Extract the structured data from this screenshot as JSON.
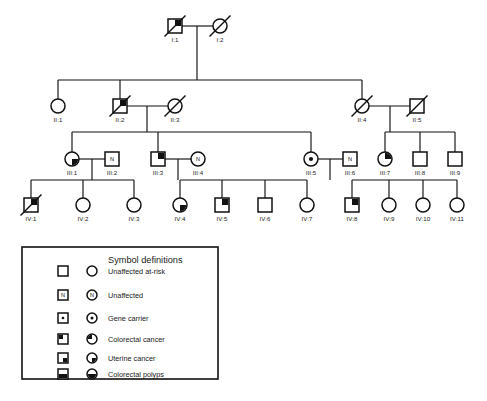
{
  "figure": {
    "type": "pedigree-chart",
    "background": "#ffffff",
    "line_color": "#111111",
    "fill_color": "#121212"
  },
  "legend": {
    "title": "Symbol definitions",
    "rows": [
      {
        "label": "Unaffected at-risk",
        "pattern": "empty"
      },
      {
        "label": "Unaffected",
        "pattern": "letter-n",
        "letter": "N"
      },
      {
        "label": "Gene carrier",
        "pattern": "center-dot"
      },
      {
        "label": "Colorectal cancer",
        "pattern": "upper-left"
      },
      {
        "label": "Uterine cancer",
        "pattern": "lower-right"
      },
      {
        "label": "Colorectal polyps",
        "pattern": "lower-half"
      }
    ]
  },
  "generations": [
    {
      "roman": "I",
      "individuals": [
        {
          "id": "I:1",
          "sex": "male",
          "pattern": "upper-right",
          "deceased": true
        },
        {
          "id": "I:2",
          "sex": "female",
          "pattern": "empty",
          "deceased": true
        }
      ]
    },
    {
      "roman": "II",
      "individuals": [
        {
          "id": "II:1",
          "sex": "female",
          "pattern": "empty",
          "deceased": false
        },
        {
          "id": "II:2",
          "sex": "male",
          "pattern": "upper-right",
          "deceased": true
        },
        {
          "id": "II:3",
          "sex": "female",
          "pattern": "empty",
          "deceased": true
        },
        {
          "id": "II:4",
          "sex": "female",
          "pattern": "empty",
          "deceased": true
        },
        {
          "id": "II:5",
          "sex": "male",
          "pattern": "empty",
          "deceased": true
        }
      ]
    },
    {
      "roman": "III",
      "individuals": [
        {
          "id": "III:1",
          "sex": "female",
          "pattern": "lower-right",
          "deceased": false
        },
        {
          "id": "III:2",
          "sex": "male",
          "pattern": "letter-n",
          "letter": "N",
          "deceased": false
        },
        {
          "id": "III:3",
          "sex": "male",
          "pattern": "upper-right",
          "deceased": false
        },
        {
          "id": "III:4",
          "sex": "female",
          "pattern": "letter-n",
          "letter": "N",
          "deceased": false
        },
        {
          "id": "III:5",
          "sex": "female",
          "pattern": "center-dot",
          "deceased": false
        },
        {
          "id": "III:6",
          "sex": "male",
          "pattern": "letter-n",
          "letter": "N",
          "deceased": false
        },
        {
          "id": "III:7",
          "sex": "female",
          "pattern": "upper-right",
          "deceased": false
        },
        {
          "id": "III:8",
          "sex": "male",
          "pattern": "empty",
          "deceased": false
        },
        {
          "id": "III:9",
          "sex": "male",
          "pattern": "empty",
          "deceased": false
        }
      ]
    },
    {
      "roman": "IV",
      "individuals": [
        {
          "id": "IV:1",
          "sex": "male",
          "pattern": "upper-right",
          "deceased": true
        },
        {
          "id": "IV:2",
          "sex": "female",
          "pattern": "empty",
          "deceased": false
        },
        {
          "id": "IV:3",
          "sex": "female",
          "pattern": "empty",
          "deceased": false
        },
        {
          "id": "IV:4",
          "sex": "female",
          "pattern": "lower-right",
          "deceased": false
        },
        {
          "id": "IV:5",
          "sex": "male",
          "pattern": "upper-right",
          "deceased": false
        },
        {
          "id": "IV:6",
          "sex": "male",
          "pattern": "empty",
          "deceased": false
        },
        {
          "id": "IV:7",
          "sex": "female",
          "pattern": "empty",
          "deceased": false
        },
        {
          "id": "IV:8",
          "sex": "male",
          "pattern": "upper-right",
          "deceased": false
        },
        {
          "id": "IV:9",
          "sex": "female",
          "pattern": "empty",
          "deceased": false
        },
        {
          "id": "IV:10",
          "sex": "female",
          "pattern": "empty",
          "deceased": false
        },
        {
          "id": "IV:11",
          "sex": "female",
          "pattern": "empty",
          "deceased": false
        }
      ]
    }
  ],
  "layout": {
    "symbol_half": 7.0,
    "legend_symbol_half": 5.0,
    "positions": {
      "I:1": {
        "x": 175,
        "y": 26
      },
      "I:2": {
        "x": 220,
        "y": 26
      },
      "II:1": {
        "x": 58,
        "y": 106
      },
      "II:2": {
        "x": 120,
        "y": 106
      },
      "II:3": {
        "x": 175,
        "y": 106
      },
      "II:4": {
        "x": 362,
        "y": 106
      },
      "II:5": {
        "x": 417,
        "y": 106
      },
      "III:1": {
        "x": 72,
        "y": 159
      },
      "III:2": {
        "x": 112,
        "y": 159
      },
      "III:3": {
        "x": 158,
        "y": 159
      },
      "III:4": {
        "x": 198,
        "y": 159
      },
      "III:5": {
        "x": 311,
        "y": 159
      },
      "III:6": {
        "x": 350,
        "y": 159
      },
      "III:7": {
        "x": 385,
        "y": 159
      },
      "III:8": {
        "x": 420,
        "y": 159
      },
      "III:9": {
        "x": 455,
        "y": 159
      },
      "IV:1": {
        "x": 31,
        "y": 205
      },
      "IV:2": {
        "x": 83,
        "y": 205
      },
      "IV:3": {
        "x": 134,
        "y": 205
      },
      "IV:4": {
        "x": 180,
        "y": 205
      },
      "IV:5": {
        "x": 222,
        "y": 205
      },
      "IV:6": {
        "x": 265,
        "y": 205
      },
      "IV:7": {
        "x": 307,
        "y": 205
      },
      "IV:8": {
        "x": 352,
        "y": 205
      },
      "IV:9": {
        "x": 389,
        "y": 205
      },
      "IV:10": {
        "x": 423,
        "y": 205
      },
      "IV:11": {
        "x": 457,
        "y": 205
      }
    },
    "legend_rect": {
      "x": 22,
      "y": 247,
      "w": 196,
      "h": 132
    },
    "legend_square_x": 63,
    "legend_circle_x": 92,
    "legend_text_x": 108,
    "legend_title_x": 108,
    "legend_title_y": 263,
    "legend_row_y": [
      271,
      295,
      318,
      339,
      358,
      374
    ]
  },
  "connections": {
    "mating_lines": [
      {
        "name": "I1-I2",
        "x1": 182,
        "x2": 213,
        "y": 26
      },
      {
        "name": "II2-II3",
        "x1": 127,
        "x2": 168,
        "y": 106
      },
      {
        "name": "II4-II5",
        "x1": 369,
        "x2": 410,
        "y": 106
      },
      {
        "name": "III1-III2",
        "x1": 79,
        "x2": 105,
        "y": 159
      },
      {
        "name": "III3-III4",
        "x1": 165,
        "x2": 191,
        "y": 159
      },
      {
        "name": "III5-III6",
        "x1": 318,
        "x2": 343,
        "y": 159
      }
    ],
    "sibships": [
      {
        "name": "gen-II-sibship",
        "drop_x": 197,
        "drop_y1": 26,
        "bar_y": 80,
        "x1": 58,
        "x2": 362,
        "children_x": [
          58,
          120,
          362
        ]
      },
      {
        "name": "gen-III-A",
        "drop_x": 147,
        "drop_y1": 106,
        "bar_y": 132,
        "x1": 72,
        "x2": 311,
        "children_x": [
          72,
          158,
          311
        ]
      },
      {
        "name": "gen-III-B",
        "drop_x": 390,
        "drop_y1": 106,
        "bar_y": 132,
        "x1": 385,
        "x2": 455,
        "children_x": [
          385,
          420,
          455
        ]
      },
      {
        "name": "gen-IV-A",
        "drop_x": 92,
        "drop_y1": 159,
        "bar_y": 180,
        "x1": 31,
        "x2": 134,
        "children_x": [
          31,
          83,
          134
        ]
      },
      {
        "name": "gen-IV-B",
        "drop_x": 178,
        "drop_y1": 159,
        "bar_y": 180,
        "x1": 180,
        "x2": 307,
        "children_x": [
          180,
          222,
          265,
          307
        ]
      },
      {
        "name": "gen-IV-C",
        "drop_x": 330,
        "drop_y1": 159,
        "bar_y": 180,
        "x1": 352,
        "x2": 457,
        "children_x": [
          352,
          389,
          423,
          457
        ]
      }
    ]
  }
}
